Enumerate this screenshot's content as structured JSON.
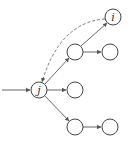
{
  "diagram": {
    "nodes": [
      {
        "id": "j",
        "label": "j",
        "x": 39,
        "y": 90
      },
      {
        "id": "i",
        "label": "i",
        "x": 113,
        "y": 17
      },
      {
        "id": "a",
        "label": "",
        "x": 75,
        "y": 52
      },
      {
        "id": "b",
        "label": "",
        "x": 110,
        "y": 52
      },
      {
        "id": "c",
        "label": "",
        "x": 75,
        "y": 90
      },
      {
        "id": "d",
        "label": "",
        "x": 75,
        "y": 127
      },
      {
        "id": "e",
        "label": "",
        "x": 110,
        "y": 127
      }
    ],
    "edges": [
      {
        "from": "in",
        "to": "j",
        "style": "solid"
      },
      {
        "from": "j",
        "to": "a",
        "style": "solid"
      },
      {
        "from": "j",
        "to": "c",
        "style": "solid"
      },
      {
        "from": "j",
        "to": "d",
        "style": "solid"
      },
      {
        "from": "a",
        "to": "i",
        "style": "solid"
      },
      {
        "from": "a",
        "to": "b",
        "style": "solid"
      },
      {
        "from": "d",
        "to": "e",
        "style": "solid"
      },
      {
        "from": "i",
        "to": "j",
        "style": "dashed"
      }
    ],
    "node_radius": 8,
    "colors": {
      "stroke": "#444444",
      "background": "#ffffff"
    }
  }
}
